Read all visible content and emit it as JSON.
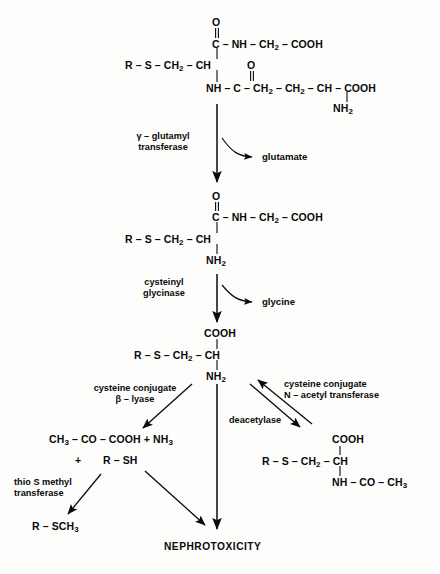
{
  "diagram": {
    "endpoint": "NEPHROTOXICITY",
    "ink_color": "#0a0a0a",
    "background_color": "#fdfdfb"
  },
  "structures": {
    "glutathione_conjugate": {
      "name": "glutathione-conjugate",
      "backbone": "R – S – CH2 – CH",
      "backbone_parts": [
        "R",
        "S",
        "CH",
        "CH"
      ],
      "carbonyl_o_top": "O",
      "glycine_arm": "C – NH – CH2 – COOH",
      "glutamyl_arm_o": "O",
      "glutamyl_arm": "NH – C – CH2 – CH2 – CH – COOH",
      "glutamyl_amino": "NH2"
    },
    "cysteinylglycine_conjugate": {
      "name": "cysteinylglycine-conjugate",
      "carbonyl_o_top": "O",
      "glycine_arm": "C – NH – CH2 – COOH",
      "backbone": "R – S – CH2 – CH",
      "amino": "NH2"
    },
    "cysteine_conjugate": {
      "name": "cysteine-conjugate",
      "carboxyl_top": "COOH",
      "backbone": "R – S – CH2 – CH",
      "amino": "NH2"
    },
    "mercapturic_acid": {
      "name": "mercapturic-acid",
      "carboxyl_top": "COOH",
      "backbone": "R – S – CH2 – CH",
      "acetamido": "NH – CO – CH3"
    },
    "beta_lyase_products": {
      "name": "beta-lyase-products",
      "line1": "CH3 – CO – COOH + NH3",
      "plus": "+",
      "line2": "R – SH"
    },
    "methylated_thiol": {
      "name": "methylated-thiol",
      "formula": "R – SCH3"
    }
  },
  "enzymes": [
    {
      "id": "gamma-glutamyl-transferase",
      "line1": "γ – glutamyl",
      "line2": "transferase"
    },
    {
      "id": "cysteinyl-glycinase",
      "line1": "cysteinyl",
      "line2": "glycinase"
    },
    {
      "id": "cysteine-conjugate-beta-lyase",
      "line1": "cysteine conjugate",
      "line2": "β – lyase"
    },
    {
      "id": "cysteine-conjugate-n-acetyl-transferase",
      "line1": "cysteine conjugate",
      "line2": "N – acetyl transferase"
    },
    {
      "id": "deacetylase",
      "line1": "deacetylase",
      "line2": ""
    },
    {
      "id": "thio-s-methyl-transferase",
      "line1": "thio S methyl",
      "line2": "transferase"
    }
  ],
  "cofactors": [
    {
      "id": "glutamate",
      "label": "glutamate"
    },
    {
      "id": "glycine",
      "label": "glycine"
    }
  ]
}
